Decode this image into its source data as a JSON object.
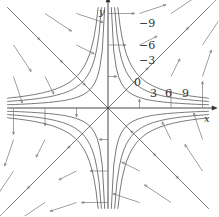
{
  "figure": {
    "axes": {
      "x_label": "x",
      "y_label": "y"
    },
    "origin_px": [
      108,
      108
    ],
    "scale_px": 10.5,
    "level_values": [
      -9,
      -6,
      -3,
      0,
      3,
      6,
      9
    ],
    "level_labels": [
      {
        "text": "−9",
        "x": 139,
        "y": 18
      },
      {
        "text": "−6",
        "x": 139,
        "y": 40
      },
      {
        "text": "−3",
        "x": 139,
        "y": 55
      },
      {
        "text": "0",
        "x": 134,
        "y": 77
      },
      {
        "text": "3",
        "x": 150,
        "y": 88
      },
      {
        "text": "6",
        "x": 165,
        "y": 88
      },
      {
        "text": "9",
        "x": 182,
        "y": 88
      }
    ],
    "colors": {
      "curves": "#555555",
      "axes": "#333333",
      "arrows": "#777777"
    }
  }
}
